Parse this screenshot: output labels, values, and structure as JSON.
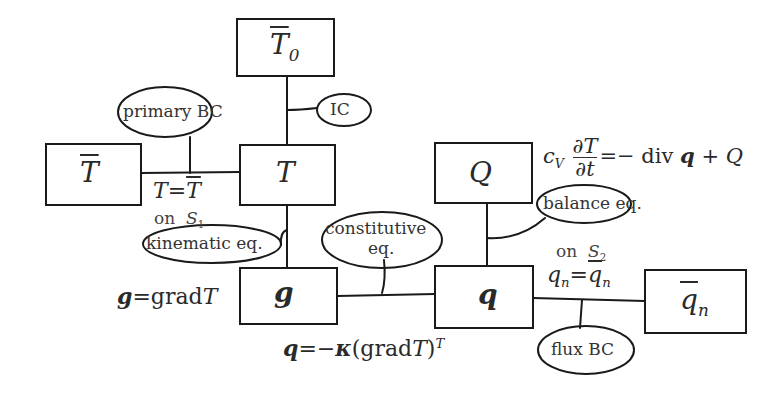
{
  "diagram": {
    "type": "tonti-diagram",
    "boxes": {
      "T0bar": {
        "symbol": "T",
        "subscript": "0",
        "overbar": true
      },
      "Tbar": {
        "symbol": "T",
        "overbar": true
      },
      "T": {
        "symbol": "T"
      },
      "Q": {
        "symbol": "Q"
      },
      "g": {
        "symbol": "g",
        "bold": true
      },
      "q": {
        "symbol": "q",
        "bold": true
      },
      "qnbar": {
        "symbol": "q",
        "subscript": "n",
        "overbar": true
      }
    },
    "bubbles": {
      "ic": "IC",
      "primary_bc": "primary BC",
      "kinematic": "kinematic eq.",
      "constitutive_1": "constitutive",
      "constitutive_2": "eq.",
      "balance": "balance eq.",
      "flux_bc": "flux BC"
    },
    "equations": {
      "primary_bc": {
        "lhs": "T",
        "eq": "=",
        "rhs": "T"
      },
      "on_s1": {
        "on": "on",
        "surface": "S",
        "sub": "1"
      },
      "kinematic": {
        "lhs": "g",
        "eq": "=grad",
        "rhs": "T"
      },
      "constitutive": {
        "lhs": "q",
        "eq": "=−",
        "kappa": "κ",
        "paren": "(grad",
        "T": "T",
        "close": ")",
        "sup": "T"
      },
      "balance": {
        "c": "c",
        "csub": "V",
        "num": "∂T",
        "den": "∂t",
        "rhs": "=− div",
        "q": "q",
        "plus": " + Q"
      },
      "on_s2": {
        "on": "on",
        "surface": "S",
        "sub": "2"
      },
      "flux_bc": {
        "lhs": "q",
        "lsub": "n",
        "eq": "=",
        "rhs": "q",
        "rsub": "n"
      }
    }
  }
}
